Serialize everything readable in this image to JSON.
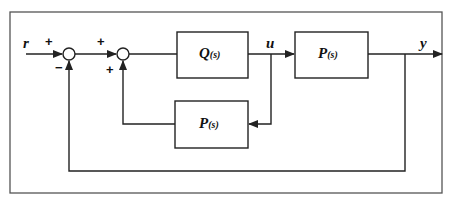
{
  "diagram": {
    "type": "block-diagram",
    "signals": {
      "input": "r",
      "control": "u",
      "output": "y"
    },
    "summing_junctions": [
      {
        "id": "sum1",
        "signs": {
          "input": "+",
          "feedback": "−"
        }
      },
      {
        "id": "sum2",
        "signs": {
          "input": "+",
          "feedback": "+"
        }
      }
    ],
    "blocks": [
      {
        "id": "Q",
        "name": "Q",
        "arg": "(s)"
      },
      {
        "id": "P_plant",
        "name": "P",
        "arg": "(s)"
      },
      {
        "id": "P_model",
        "name": "P",
        "arg": "(s)"
      }
    ],
    "colors": {
      "line": "#222222",
      "frame": "#555555",
      "background": "#ffffff"
    }
  }
}
